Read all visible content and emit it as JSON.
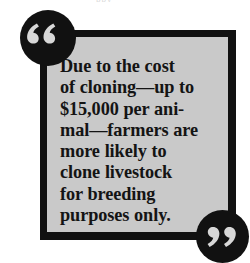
{
  "figure": {
    "kind": "pull-quote",
    "quote_text": "Due to the cost\nof cloning—up to\n$15,000 per ani-\nmal—farmers are\nmore likely to\nclone livestock\nfor breeding\npurposes only.",
    "quote_plain": "Due to the cost of cloning—up to $15,000 per animal—farmers are more likely to clone livestock for breeding purposes only.",
    "amount": "$15,000",
    "open_quote_mark": "66",
    "close_quote_mark": "99",
    "top_sliver_text": "ppy",
    "icons": {
      "open_quote": "open-quote-icon",
      "close_quote": "close-quote-icon"
    },
    "colors": {
      "page_background": "#ffffff",
      "box_fill": "#c9c9c9",
      "box_border": "#111111",
      "text": "#141414",
      "quote_disc": "#111111",
      "quote_glyph": "#d7d7d7"
    }
  }
}
